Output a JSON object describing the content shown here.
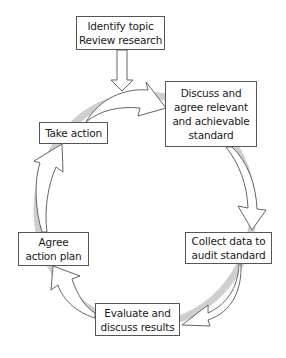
{
  "diagram": {
    "type": "cycle",
    "entry": {
      "id": "identify",
      "label": "Identify topic\nReview research"
    },
    "steps": [
      {
        "id": "discuss",
        "label": "Discuss and\nagree relevant\nand achievable\nstandard"
      },
      {
        "id": "collect",
        "label": "Collect data to\naudit standard"
      },
      {
        "id": "evaluate",
        "label": "Evaluate and\ndiscuss results"
      },
      {
        "id": "agree",
        "label": "Agree\naction plan"
      },
      {
        "id": "take",
        "label": "Take action"
      }
    ],
    "edges": [
      {
        "from": "identify",
        "to": "cycle"
      },
      {
        "from": "take",
        "to": "discuss"
      },
      {
        "from": "discuss",
        "to": "collect"
      },
      {
        "from": "collect",
        "to": "evaluate"
      },
      {
        "from": "evaluate",
        "to": "agree"
      },
      {
        "from": "agree",
        "to": "take"
      }
    ],
    "colors": {
      "border": "#555555",
      "text": "#1a1a1a",
      "arrow_fill": "#ffffff",
      "ring_shadow": "#c8c8c8"
    }
  }
}
